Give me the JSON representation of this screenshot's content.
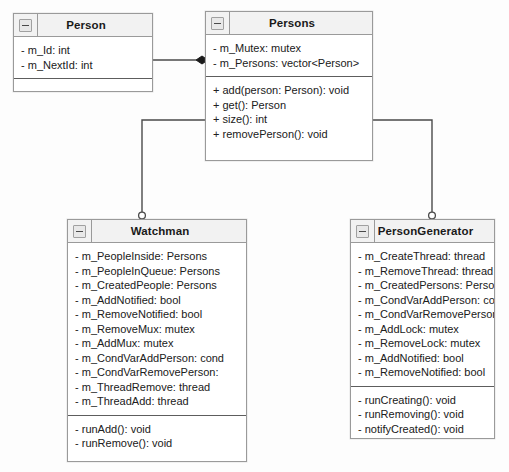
{
  "diagram": {
    "type": "uml-class-diagram",
    "background": "#fdfdfd",
    "line_color": "#4a4a4a",
    "header_color": "#f2f2f2",
    "border_color": "#9a9a9a"
  },
  "classes": [
    {
      "id": "person",
      "name": "Person",
      "icon": "collapse-minus-icon",
      "x": 13,
      "y": 13,
      "width": 140,
      "height": 79,
      "attributes": [
        "- m_Id: int",
        "- m_NextId: int"
      ],
      "methods": []
    },
    {
      "id": "persons",
      "name": "Persons",
      "icon": "collapse-minus-icon",
      "x": 205,
      "y": 11,
      "width": 168,
      "height": 150,
      "attributes": [
        "- m_Mutex: mutex",
        "- m_Persons: vector<Person>"
      ],
      "methods": [
        "+ add(person: Person): void",
        "+ get(): Person",
        "+ size(): int",
        "+ removePerson(): void"
      ]
    },
    {
      "id": "watchman",
      "name": "Watchman",
      "icon": "collapse-minus-icon",
      "x": 67,
      "y": 219,
      "width": 180,
      "height": 243,
      "attributes": [
        "- m_PeopleInside: Persons",
        "- m_PeopleInQueue: Persons",
        "- m_CreatedPeople: Persons",
        "- m_AddNotified: bool",
        "- m_RemoveNotified: bool",
        "- m_RemoveMux: mutex",
        "- m_AddMux: mutex",
        "- m_CondVarAddPerson: cond",
        "- m_CondVarRemovePerson:",
        "- m_ThreadRemove: thread",
        "- m_ThreadAdd: thread"
      ],
      "methods": [
        "- runAdd(): void",
        "- runRemove(): void"
      ]
    },
    {
      "id": "persongenerator",
      "name": "PersonGenerator",
      "icon": "collapse-minus-icon",
      "x": 350,
      "y": 219,
      "width": 145,
      "height": 220,
      "attributes": [
        "- m_CreateThread: thread",
        "- m_RemoveThread: thread",
        "- m_CreatedPersons: Person",
        "- m_CondVarAddPerson: co",
        "- m_CondVarRemovePerson",
        "- m_AddLock: mutex",
        "- m_RemoveLock: mutex",
        "- m_AddNotified: bool",
        "- m_RemoveNotified: bool"
      ],
      "methods": [
        "- runCreating(): void",
        "- runRemoving(): void",
        "- notifyCreated(): void",
        "- notifyRemoved(): void"
      ]
    }
  ],
  "connectors": [
    {
      "id": "person-to-persons",
      "type": "composition",
      "from": "person",
      "to": "persons",
      "marker": "filled-diamond",
      "marker_at": "persons"
    },
    {
      "id": "persons-to-watchman",
      "type": "association",
      "from": "persons",
      "to": "watchman",
      "marker": "hollow-circle",
      "marker_at": "watchman"
    },
    {
      "id": "persons-to-persongenerator",
      "type": "association",
      "from": "persons",
      "to": "persongenerator",
      "marker": "hollow-circle",
      "marker_at": "persongenerator"
    }
  ]
}
